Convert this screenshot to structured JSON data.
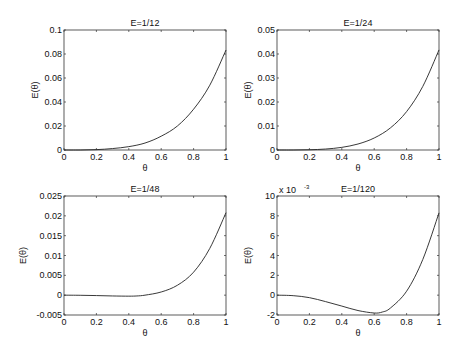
{
  "chart_data": [
    {
      "type": "line",
      "title": "E=1/12",
      "xlabel": "θ",
      "ylabel": "E(θ)",
      "xlim": [
        0,
        1
      ],
      "ylim": [
        0,
        0.1
      ],
      "xticks": [
        "0",
        "0.2",
        "0.4",
        "0.6",
        "0.8",
        "1"
      ],
      "xtick_values": [
        0,
        0.2,
        0.4,
        0.6,
        0.8,
        1
      ],
      "yticks": [
        "0",
        "0.02",
        "0.04",
        "0.06",
        "0.08",
        "0.1"
      ],
      "ytick_values": [
        0,
        0.02,
        0.04,
        0.06,
        0.08,
        0.1
      ],
      "exponent_label": "",
      "series": [
        {
          "name": "E(θ)",
          "x": [
            0,
            0.1,
            0.2,
            0.3,
            0.4,
            0.5,
            0.6,
            0.7,
            0.8,
            0.9,
            1.0
          ],
          "y": [
            0,
            0.0,
            0.0003,
            0.0012,
            0.0028,
            0.0058,
            0.0115,
            0.02,
            0.034,
            0.054,
            0.0833
          ]
        }
      ]
    },
    {
      "type": "line",
      "title": "E=1/24",
      "xlabel": "θ",
      "ylabel": "E(θ)",
      "xlim": [
        0,
        1
      ],
      "ylim": [
        0,
        0.05
      ],
      "xticks": [
        "0",
        "0.2",
        "0.4",
        "0.6",
        "0.8",
        "1"
      ],
      "xtick_values": [
        0,
        0.2,
        0.4,
        0.6,
        0.8,
        1
      ],
      "yticks": [
        "0",
        "0.01",
        "0.02",
        "0.03",
        "0.04",
        "0.05"
      ],
      "ytick_values": [
        0,
        0.01,
        0.02,
        0.03,
        0.04,
        0.05
      ],
      "exponent_label": "",
      "series": [
        {
          "name": "E(θ)",
          "x": [
            0,
            0.1,
            0.2,
            0.3,
            0.4,
            0.5,
            0.6,
            0.7,
            0.8,
            0.9,
            1.0
          ],
          "y": [
            0,
            0.0,
            0.0001,
            0.0004,
            0.0011,
            0.0025,
            0.005,
            0.0092,
            0.016,
            0.0265,
            0.0417
          ]
        }
      ]
    },
    {
      "type": "line",
      "title": "E=1/48",
      "xlabel": "θ",
      "ylabel": "E(θ)",
      "xlim": [
        0,
        1
      ],
      "ylim": [
        -0.005,
        0.025
      ],
      "xticks": [
        "0",
        "0.2",
        "0.4",
        "0.6",
        "0.8",
        "1"
      ],
      "xtick_values": [
        0,
        0.2,
        0.4,
        0.6,
        0.8,
        1
      ],
      "yticks": [
        "-0.005",
        "0",
        "0.005",
        "0.01",
        "0.015",
        "0.02",
        "0.025"
      ],
      "ytick_values": [
        -0.005,
        0,
        0.005,
        0.01,
        0.015,
        0.02,
        0.025
      ],
      "exponent_label": "",
      "series": [
        {
          "name": "E(θ)",
          "x": [
            0,
            0.1,
            0.2,
            0.3,
            0.4,
            0.45,
            0.5,
            0.6,
            0.7,
            0.8,
            0.9,
            1.0
          ],
          "y": [
            0,
            -3e-05,
            -0.0001,
            -0.0002,
            -0.00025,
            -0.0002,
            0.0,
            0.0008,
            0.0025,
            0.0058,
            0.0118,
            0.0208
          ]
        }
      ]
    },
    {
      "type": "line",
      "title": "E=1/120",
      "xlabel": "θ",
      "ylabel": "E(θ)",
      "xlim": [
        0,
        1
      ],
      "ylim": [
        -2,
        10
      ],
      "xticks": [
        "0",
        "0.2",
        "0.4",
        "0.6",
        "0.8",
        "1"
      ],
      "xtick_values": [
        0,
        0.2,
        0.4,
        0.6,
        0.8,
        1
      ],
      "yticks": [
        "-2",
        "0",
        "2",
        "4",
        "6",
        "8",
        "10"
      ],
      "ytick_values": [
        -2,
        0,
        2,
        4,
        6,
        8,
        10
      ],
      "exponent_label": "x 10",
      "exponent_power": "-3",
      "series": [
        {
          "name": "E(θ) ×10⁻³",
          "x": [
            0,
            0.1,
            0.2,
            0.3,
            0.4,
            0.5,
            0.6,
            0.65,
            0.7,
            0.8,
            0.9,
            1.0
          ],
          "y": [
            0,
            -0.05,
            -0.25,
            -0.65,
            -1.1,
            -1.55,
            -1.8,
            -1.7,
            -1.3,
            0.4,
            3.6,
            8.3
          ]
        }
      ]
    }
  ]
}
